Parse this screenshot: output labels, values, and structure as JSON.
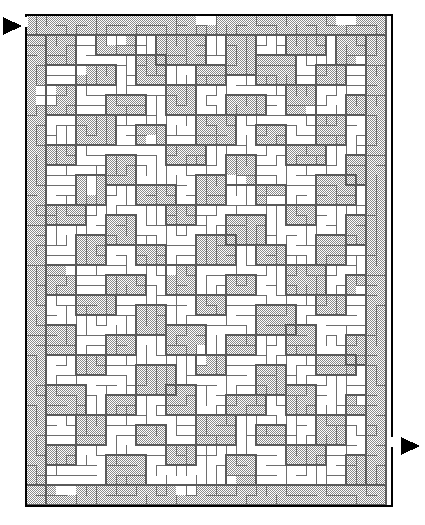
{
  "figure": {
    "kind": "maze-puzzle",
    "title": "Rectangular Maze",
    "caption": "",
    "background_color": "#ffffff"
  },
  "maze": {
    "shape": "rectangle",
    "cols": 36,
    "rows": 49,
    "cell_px": 10,
    "origin_x": 26,
    "origin_y": 15,
    "width_px": 366,
    "height_px": 491,
    "border_color": "#000000",
    "border_width": 2,
    "wall_color": "#6e6e6e",
    "wall_width": 1,
    "passage_color": "#ffffff",
    "shaded_color": "#b4b4b4",
    "shade_pattern": "checker-dither-50",
    "shade_dot_color": "#8a8a8a"
  },
  "entrance": {
    "label": "entrance",
    "side": "left",
    "marker": "triangle-right-icon",
    "marker_color": "#000000",
    "x": 3,
    "y": 17,
    "width": 19,
    "height": 18,
    "gap_x": 26,
    "gap_y": 17,
    "gap_height": 10
  },
  "exit": {
    "label": "exit",
    "side": "right",
    "marker": "triangle-right-icon",
    "marker_color": "#000000",
    "x": 401,
    "y": 437,
    "width": 19,
    "height": 18,
    "gap_x": 392,
    "gap_y": 437,
    "gap_height": 10
  },
  "shaded_regions": [
    [
      0,
      0,
      36,
      2
    ],
    [
      0,
      2,
      2,
      47
    ],
    [
      34,
      2,
      2,
      45
    ],
    [
      0,
      47,
      36,
      2
    ],
    [
      2,
      2,
      3,
      3
    ],
    [
      7,
      2,
      4,
      2
    ],
    [
      13,
      2,
      5,
      3
    ],
    [
      20,
      2,
      3,
      4
    ],
    [
      26,
      2,
      4,
      2
    ],
    [
      31,
      2,
      3,
      3
    ],
    [
      5,
      5,
      4,
      2
    ],
    [
      11,
      4,
      3,
      3
    ],
    [
      17,
      5,
      3,
      2
    ],
    [
      23,
      4,
      4,
      3
    ],
    [
      29,
      5,
      3,
      2
    ],
    [
      2,
      7,
      3,
      3
    ],
    [
      8,
      8,
      4,
      2
    ],
    [
      14,
      7,
      3,
      3
    ],
    [
      20,
      8,
      4,
      2
    ],
    [
      26,
      7,
      3,
      3
    ],
    [
      32,
      8,
      2,
      2
    ],
    [
      5,
      10,
      4,
      3
    ],
    [
      11,
      11,
      3,
      2
    ],
    [
      17,
      10,
      4,
      3
    ],
    [
      23,
      11,
      3,
      2
    ],
    [
      29,
      10,
      3,
      3
    ],
    [
      2,
      13,
      3,
      2
    ],
    [
      8,
      14,
      3,
      3
    ],
    [
      14,
      13,
      4,
      2
    ],
    [
      20,
      14,
      3,
      3
    ],
    [
      26,
      13,
      4,
      2
    ],
    [
      32,
      14,
      2,
      3
    ],
    [
      5,
      16,
      3,
      3
    ],
    [
      11,
      17,
      4,
      2
    ],
    [
      17,
      16,
      3,
      3
    ],
    [
      23,
      17,
      3,
      2
    ],
    [
      29,
      16,
      4,
      3
    ],
    [
      2,
      19,
      4,
      2
    ],
    [
      8,
      20,
      3,
      3
    ],
    [
      14,
      19,
      3,
      2
    ],
    [
      20,
      20,
      4,
      3
    ],
    [
      26,
      19,
      3,
      2
    ],
    [
      32,
      20,
      2,
      3
    ],
    [
      5,
      22,
      3,
      3
    ],
    [
      11,
      23,
      3,
      2
    ],
    [
      17,
      22,
      4,
      3
    ],
    [
      23,
      23,
      3,
      2
    ],
    [
      29,
      22,
      3,
      3
    ],
    [
      2,
      25,
      3,
      3
    ],
    [
      8,
      26,
      4,
      2
    ],
    [
      14,
      25,
      3,
      3
    ],
    [
      20,
      26,
      3,
      2
    ],
    [
      26,
      25,
      4,
      3
    ],
    [
      32,
      26,
      2,
      2
    ],
    [
      5,
      28,
      4,
      2
    ],
    [
      11,
      29,
      3,
      3
    ],
    [
      17,
      28,
      3,
      2
    ],
    [
      23,
      29,
      4,
      3
    ],
    [
      29,
      28,
      3,
      2
    ],
    [
      2,
      31,
      3,
      3
    ],
    [
      8,
      32,
      3,
      2
    ],
    [
      14,
      31,
      4,
      3
    ],
    [
      20,
      32,
      3,
      2
    ],
    [
      26,
      31,
      3,
      3
    ],
    [
      32,
      32,
      2,
      3
    ],
    [
      5,
      34,
      3,
      2
    ],
    [
      11,
      35,
      4,
      3
    ],
    [
      17,
      34,
      3,
      2
    ],
    [
      23,
      35,
      3,
      3
    ],
    [
      29,
      34,
      4,
      2
    ],
    [
      2,
      37,
      4,
      3
    ],
    [
      8,
      38,
      3,
      2
    ],
    [
      14,
      37,
      3,
      3
    ],
    [
      20,
      38,
      4,
      2
    ],
    [
      26,
      37,
      3,
      3
    ],
    [
      32,
      38,
      2,
      2
    ],
    [
      5,
      40,
      3,
      3
    ],
    [
      11,
      41,
      3,
      2
    ],
    [
      17,
      40,
      4,
      3
    ],
    [
      23,
      41,
      3,
      2
    ],
    [
      29,
      40,
      3,
      3
    ],
    [
      2,
      43,
      3,
      2
    ],
    [
      8,
      44,
      4,
      3
    ],
    [
      14,
      43,
      3,
      2
    ],
    [
      20,
      44,
      3,
      3
    ],
    [
      26,
      43,
      4,
      2
    ],
    [
      32,
      44,
      2,
      3
    ]
  ],
  "white_patches": [
    [
      17,
      0,
      2,
      1
    ],
    [
      31,
      0,
      2,
      1
    ],
    [
      8,
      2,
      2,
      1
    ],
    [
      4,
      5,
      2,
      1
    ],
    [
      33,
      4,
      1,
      2
    ],
    [
      1,
      7,
      2,
      2
    ],
    [
      28,
      9,
      2,
      1
    ],
    [
      12,
      12,
      1,
      2
    ],
    [
      33,
      17,
      1,
      2
    ],
    [
      24,
      18,
      2,
      1
    ],
    [
      6,
      16,
      1,
      2
    ],
    [
      20,
      16,
      2,
      1
    ],
    [
      31,
      19,
      2,
      1
    ],
    [
      4,
      25,
      2,
      1
    ],
    [
      14,
      24,
      1,
      2
    ],
    [
      26,
      22,
      2,
      1
    ],
    [
      9,
      30,
      2,
      1
    ],
    [
      21,
      28,
      2,
      1
    ],
    [
      33,
      27,
      1,
      2
    ],
    [
      2,
      34,
      2,
      1
    ],
    [
      17,
      33,
      1,
      2
    ],
    [
      29,
      32,
      2,
      1
    ],
    [
      12,
      40,
      2,
      1
    ],
    [
      25,
      38,
      1,
      2
    ],
    [
      33,
      37,
      1,
      2
    ],
    [
      6,
      44,
      2,
      1
    ],
    [
      19,
      46,
      2,
      1
    ],
    [
      30,
      45,
      2,
      1
    ],
    [
      3,
      47,
      2,
      1
    ],
    [
      15,
      47,
      2,
      1
    ]
  ],
  "legend": {
    "entrance_text": "",
    "exit_text": ""
  }
}
